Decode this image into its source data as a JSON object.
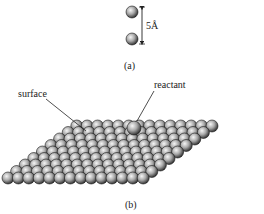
{
  "panel_a": {
    "caption": "(a)",
    "distance_label": "5Å",
    "spheres": [
      {
        "cx": 132,
        "cy": 12,
        "r": 6
      },
      {
        "cx": 132,
        "cy": 39,
        "r": 6
      }
    ],
    "arrow": {
      "x": 142,
      "y1": 7,
      "y2": 44
    }
  },
  "panel_b": {
    "caption": "(b)",
    "labels": {
      "surface": "surface",
      "reactant": "reactant"
    },
    "lattice": {
      "rows": 9,
      "cols": 14,
      "front_left": [
        8,
        178
      ],
      "front_step": [
        10.4,
        0
      ],
      "row_step": [
        8.6,
        -6.5
      ],
      "radius": 6
    },
    "reactant_sphere": {
      "cx": 134,
      "cy": 128,
      "r": 7
    },
    "leaders": {
      "surface": {
        "x1": 46,
        "y1": 99,
        "x2": 86,
        "y2": 131
      },
      "reactant": {
        "x1": 154,
        "y1": 91,
        "x2": 137,
        "y2": 121
      }
    }
  },
  "colors": {
    "sphere_light": "#f4f4f4",
    "sphere_mid": "#9a9a9a",
    "sphere_dark": "#2a2a2a",
    "line": "#222222"
  }
}
